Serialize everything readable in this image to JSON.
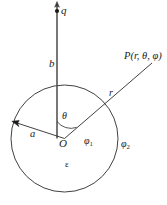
{
  "figure": {
    "labels": {
      "charge": "q",
      "distance_b": "b",
      "field_point": "P(r, θ, φ)",
      "radial_distance": "r",
      "polar_angle": "θ",
      "sphere_radius": "a",
      "origin": "O",
      "potential_inside_symbol": "φ",
      "potential_inside_sub": "1",
      "potential_outside_symbol": "φ",
      "potential_outside_sub": "2",
      "permittivity": "ε"
    },
    "colors": {
      "stroke": "#2b2b2b",
      "text": "#1a1a1a",
      "background": "#ffffff"
    },
    "geometry": {
      "circle_center_x": 64.5,
      "circle_center_y": 138.5,
      "circle_radius": 53.5,
      "axis_top_y": 2,
      "axis_bottom_y": 138.5,
      "charge_dot_x": 57,
      "charge_dot_y": 11,
      "r_ray_end_x": 152,
      "r_ray_end_y": 63,
      "a_arrow_end_x": 15,
      "a_arrow_end_y": 122
    }
  }
}
